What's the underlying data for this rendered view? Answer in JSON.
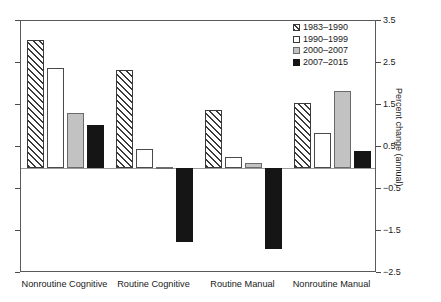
{
  "chart_data": {
    "type": "bar",
    "title": "",
    "xlabel": "",
    "ylabel": "Percent change (annual)",
    "categories": [
      "Nonroutine Cognitive",
      "Routine Cognitive",
      "Routine Manual",
      "Nonroutine Manual"
    ],
    "series": [
      {
        "name": "1983–1990",
        "values": [
          3.05,
          2.33,
          1.37,
          1.55
        ],
        "style": "diagonal-hatch",
        "color": "#ffffff"
      },
      {
        "name": "1990–1999",
        "values": [
          2.37,
          0.45,
          0.27,
          0.83
        ],
        "style": "open-white",
        "color": "#ffffff"
      },
      {
        "name": "2000–2007",
        "values": [
          1.3,
          0.02,
          0.12,
          1.83
        ],
        "style": "solid-gray",
        "color": "#c2c2c2"
      },
      {
        "name": "2007–2015",
        "values": [
          1.02,
          -1.75,
          -1.93,
          0.4
        ],
        "style": "solid-black",
        "color": "#151515"
      }
    ],
    "ylim": [
      -2.5,
      3.5
    ],
    "yticks": [
      3.5,
      2.5,
      1.5,
      0.5,
      -0.5,
      -1.5,
      -2.5
    ],
    "ytick_labels": [
      "3.5",
      "2.5",
      "1.5",
      "0.5",
      "−0.5",
      "−1.5",
      "−2.5"
    ],
    "yaxis_position": "right",
    "grid": false,
    "legend_position": "top-right",
    "zero_line": true
  },
  "legend": {
    "entries": [
      {
        "label": "1983–1990"
      },
      {
        "label": "1990–1999"
      },
      {
        "label": "2000–2007"
      },
      {
        "label": "2007–2015"
      }
    ]
  }
}
